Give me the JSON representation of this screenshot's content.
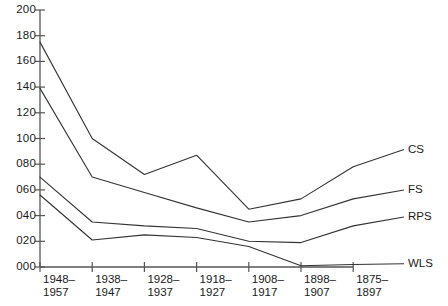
{
  "chart_data": {
    "type": "line",
    "title": "",
    "xlabel": "",
    "ylabel": "",
    "ylim": [
      0,
      200
    ],
    "ytick_step": 20,
    "grid": false,
    "legend_position": "right-edge-labels",
    "categories": [
      "1948–1957",
      "1938–1947",
      "1928–1937",
      "1918–1927",
      "1908–1917",
      "1898–1907",
      "1875–1897"
    ],
    "ytick_labels": [
      "000",
      "020",
      "040",
      "060",
      "080",
      "100",
      "120",
      "140",
      "160",
      "180",
      "200"
    ],
    "ytick_values": [
      0,
      20,
      40,
      60,
      80,
      100,
      120,
      140,
      160,
      180,
      200
    ],
    "series": [
      {
        "name": "CS",
        "values": [
          175,
          100,
          72,
          87,
          45,
          53,
          78
        ]
      },
      {
        "name": "FS",
        "values": [
          139,
          70,
          58,
          46,
          35,
          40,
          53
        ]
      },
      {
        "name": "RPS",
        "values": [
          70,
          35,
          32,
          30,
          20,
          19,
          32
        ]
      },
      {
        "name": "WLS",
        "values": [
          56,
          21,
          25,
          23,
          16,
          1,
          2
        ]
      }
    ],
    "line_color": "#333333",
    "axis_color": "#555555"
  },
  "axes": {
    "y_axis_name": "value-axis",
    "x_axis_name": "period-axis"
  }
}
